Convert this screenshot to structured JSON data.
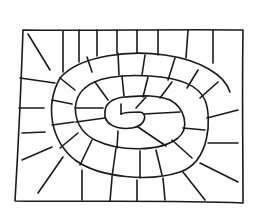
{
  "image": {
    "description": "Hand-drawn black ink sketch of a spiral board game track on white paper",
    "colors": {
      "background": "#ffffff",
      "ink": "#1a1a1a"
    }
  }
}
